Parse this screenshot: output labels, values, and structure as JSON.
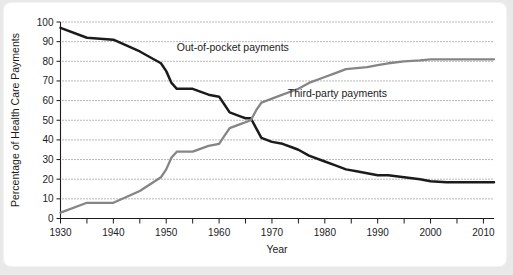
{
  "chart_data": {
    "type": "line",
    "title": "",
    "xlabel": "Year",
    "ylabel": "Percentage of Health Care Payments",
    "xlim": [
      1930,
      2012
    ],
    "ylim": [
      0,
      100
    ],
    "grid": "horizontal-dotted",
    "legend_position": "inline-annotations",
    "y_ticks": [
      0,
      10,
      20,
      30,
      40,
      50,
      60,
      70,
      80,
      90,
      100
    ],
    "x_ticks": [
      1930,
      1935,
      1940,
      1945,
      1950,
      1955,
      1960,
      1965,
      1970,
      1975,
      1980,
      1985,
      1990,
      1995,
      2000,
      2005,
      2010
    ],
    "x_tick_labels": [
      "1930",
      "",
      "1940",
      "",
      "1950",
      "",
      "1960",
      "",
      "1970",
      "",
      "1980",
      "",
      "1990",
      "",
      "2000",
      "",
      "2010"
    ],
    "series": [
      {
        "name": "Out-of-pocket payments",
        "color": "#1b1b1b",
        "label_x": 1952,
        "label_y": 85,
        "x": [
          1930,
          1935,
          1940,
          1945,
          1949,
          1950,
          1951,
          1952,
          1955,
          1958,
          1960,
          1961,
          1962,
          1963,
          1964,
          1965,
          1966,
          1967,
          1968,
          1970,
          1972,
          1974,
          1975,
          1977,
          1980,
          1982,
          1984,
          1986,
          1988,
          1990,
          1992,
          1995,
          1998,
          2000,
          2003,
          2006,
          2009,
          2012
        ],
        "values": [
          97,
          92,
          91,
          85,
          79,
          75,
          69,
          66,
          66,
          63,
          62,
          58,
          54,
          53,
          52,
          51,
          51,
          46,
          41,
          39,
          38,
          36,
          35,
          32,
          29,
          27,
          25,
          24,
          23,
          22,
          22,
          21,
          20,
          19,
          18.5,
          18.5,
          18.5,
          18.5
        ]
      },
      {
        "name": "Third-party payments",
        "color": "#858585",
        "label_x": 1973,
        "label_y": 62,
        "x": [
          1930,
          1935,
          1940,
          1945,
          1949,
          1950,
          1951,
          1952,
          1955,
          1958,
          1960,
          1961,
          1962,
          1963,
          1964,
          1965,
          1966,
          1967,
          1968,
          1970,
          1972,
          1974,
          1975,
          1977,
          1980,
          1982,
          1984,
          1986,
          1988,
          1990,
          1992,
          1995,
          1998,
          2000,
          2003,
          2006,
          2009,
          2012
        ],
        "values": [
          3,
          8,
          8,
          14,
          21,
          25,
          31,
          34,
          34,
          37,
          38,
          42,
          46,
          47,
          48,
          49,
          50,
          55,
          59,
          61,
          63,
          65,
          66,
          69,
          72,
          74,
          76,
          76.5,
          77,
          78,
          79,
          80,
          80.5,
          81,
          81,
          81,
          81,
          81
        ]
      }
    ]
  }
}
